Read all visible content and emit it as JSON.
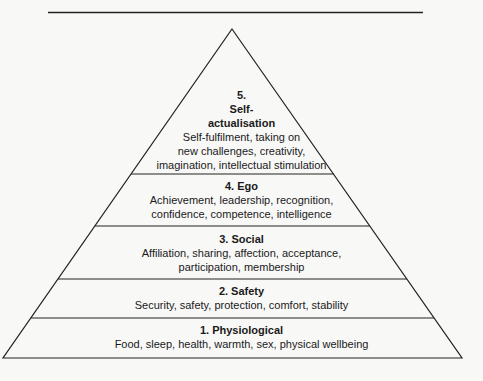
{
  "diagram": {
    "type": "pyramid",
    "levels": [
      {
        "number": "5.",
        "title_line1": "Self-",
        "title_line2": "actualisation",
        "desc_lines": [
          "Self-fulfilment, taking on",
          "new challenges, creativity,",
          "imagination, intellectual stimulation"
        ]
      },
      {
        "title": "4. Ego",
        "desc_lines": [
          "Achievement, leadership, recognition,",
          "confidence, competence, intelligence"
        ]
      },
      {
        "title": "3. Social",
        "desc_lines": [
          "Affiliation, sharing, affection, acceptance,",
          "participation, membership"
        ]
      },
      {
        "title": "2. Safety",
        "desc_lines": [
          "Security, safety, protection, comfort, stability"
        ]
      },
      {
        "title": "1. Physiological",
        "desc_lines": [
          "Food, sleep, health, warmth, sex, physical wellbeing"
        ]
      }
    ]
  }
}
